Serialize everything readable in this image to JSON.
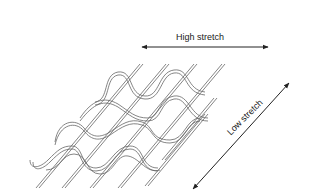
{
  "diagram": {
    "labels": {
      "high_stretch": "High stretch",
      "low_stretch": "Low stretch"
    },
    "arrows": [
      {
        "name": "high-stretch-arrow",
        "direction": "horizontal",
        "heads": "both"
      },
      {
        "name": "low-stretch-arrow",
        "direction": "diagonal",
        "heads": "both"
      }
    ],
    "colors": {
      "line": "#555555",
      "arrow": "#222222",
      "background": "#ffffff"
    }
  }
}
